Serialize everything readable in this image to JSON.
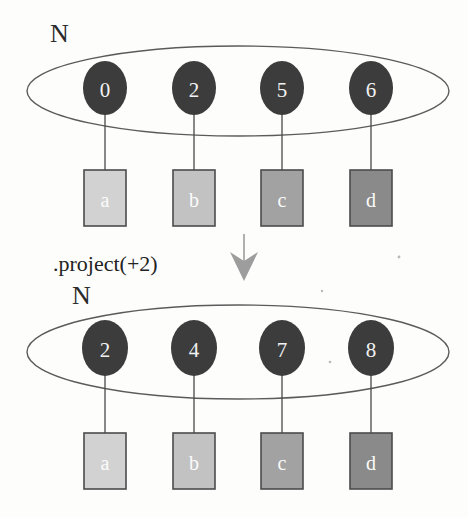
{
  "diagram": {
    "operation_label": ".project(+2)",
    "arrow_icon": "arrow-down-icon",
    "colors": {
      "background": "#fdfdfc",
      "node_fill": "#3c3c3c",
      "node_text": "#f2f2f2",
      "ellipse_stroke": "#5b5b5b",
      "edge_stroke": "#4a4a4a",
      "box_stroke": "#4b4b4b",
      "arrow_fill": "#9d9d9d",
      "label_text": "#232323"
    },
    "box_fills": [
      "#d2d2d2",
      "#c2c2c2",
      "#a2a2a2",
      "#8a8a8a"
    ],
    "stages": [
      {
        "name": "before",
        "set_label": "N",
        "nodes": [
          {
            "id": "0",
            "box": "a"
          },
          {
            "id": "2",
            "box": "b"
          },
          {
            "id": "5",
            "box": "c"
          },
          {
            "id": "6",
            "box": "d"
          }
        ]
      },
      {
        "name": "after",
        "set_label": "N",
        "nodes": [
          {
            "id": "2",
            "box": "a"
          },
          {
            "id": "4",
            "box": "b"
          },
          {
            "id": "7",
            "box": "c"
          },
          {
            "id": "8",
            "box": "d"
          }
        ]
      }
    ]
  }
}
